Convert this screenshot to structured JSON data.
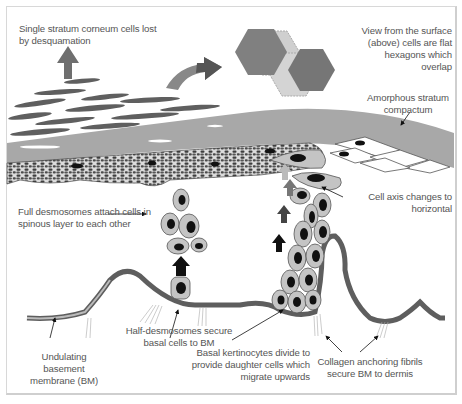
{
  "figure": {
    "title": "",
    "colors": {
      "stratum_corneum": "#6e6e6e",
      "stratum_compactum": "#a9a9a9",
      "granular_mesh": "#4a4a4a",
      "cell_fill": "#c4c4c4",
      "nucleus": "#111111",
      "basement_membrane": "#5e5e5e",
      "label_text": "#555555",
      "hexagon_dark": "#777777",
      "hexagon_light": "#c8c8c8"
    }
  },
  "labels": {
    "desquamation": "Single stratum corneum cells lost\nby desquamation",
    "surface_view": "View from the surface\n(above) cells are flat\nhexagons which\noverlap",
    "compactum": "Amorphous stratum\ncompactum",
    "cell_axis": "Cell axis changes to\nhorizontal",
    "full_desmosomes": "Full desmosomes attach cells in\nspinous layer to each other",
    "half_desmosomes": "Half-desmosomes secure\nbasal cells to BM",
    "basement_membrane": "Undulating basement\nmembrane (BM)",
    "basal_keratinocytes": "Basal kertinocytes divide to\nprovide daughter cells which\nmigrate upwards",
    "collagen_fibrils": "Collagen anchoring fibrils\nsecure BM to dermis"
  }
}
